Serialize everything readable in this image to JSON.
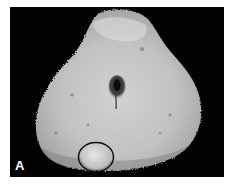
{
  "figure": {
    "panel_label": "A",
    "annotations": [
      {
        "type": "circle-outline",
        "color": "#111111",
        "position": "lower-left of specimen"
      }
    ],
    "colors": {
      "background": "#030303",
      "tissue": "#bdbdbd",
      "tissue_highlight": "#d8d8d8",
      "lumen": "#1a1a1a",
      "circle_stroke": "#111111",
      "label": "#ffffff"
    }
  }
}
